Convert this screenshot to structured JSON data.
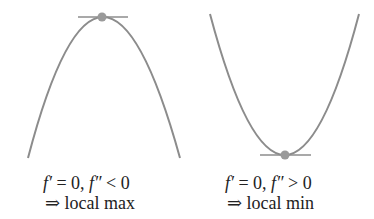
{
  "colors": {
    "curve": "#8c8c8c",
    "tangent": "#8c8c8c",
    "point": "#9a9a9a",
    "text": "#222222",
    "background": "#ffffff"
  },
  "panels": [
    {
      "name": "local-max",
      "curve_shape": "concave-down parabola",
      "point": "top vertex with horizontal tangent",
      "condition_f_prime": "f′",
      "condition_eq": " = 0, ",
      "condition_f_double": "f″",
      "condition_ineq": " < 0",
      "conclusion_arrow": "⇒",
      "conclusion_text": "local max"
    },
    {
      "name": "local-min",
      "curve_shape": "concave-up parabola",
      "point": "bottom vertex with horizontal tangent",
      "condition_f_prime": "f′",
      "condition_eq": " = 0, ",
      "condition_f_double": "f″",
      "condition_ineq": " > 0",
      "conclusion_arrow": "⇒",
      "conclusion_text": "local min"
    }
  ]
}
